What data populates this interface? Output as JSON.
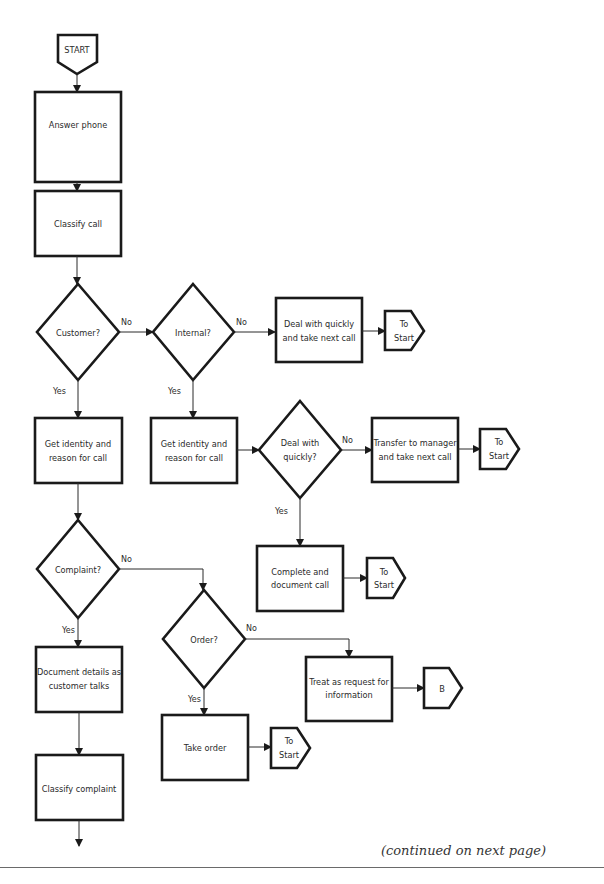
{
  "flowchart": {
    "start": {
      "label": "START"
    },
    "nodes": {
      "answer_phone": {
        "label": "Answer phone"
      },
      "classify_call": {
        "label": "Classify call"
      },
      "customer_q": {
        "label": "Customer?"
      },
      "internal_q": {
        "label": "Internal?"
      },
      "deal_quick_take_next": {
        "line1": "Deal with quickly",
        "line2": "and take next call"
      },
      "get_identity_left": {
        "line1": "Get identity and",
        "line2": "reason for call"
      },
      "get_identity_mid": {
        "line1": "Get identity and",
        "line2": "reason for call"
      },
      "deal_quickly_q": {
        "line1": "Deal with",
        "line2": "quickly?"
      },
      "transfer_manager": {
        "line1": "Transfer to manager",
        "line2": "and take next call"
      },
      "complete_document": {
        "line1": "Complete and",
        "line2": "document call"
      },
      "complaint_q": {
        "label": "Complaint?"
      },
      "order_q": {
        "label": "Order?"
      },
      "treat_request": {
        "line1": "Treat as request for",
        "line2": "information"
      },
      "document_details": {
        "line1": "Document details as",
        "line2": "customer talks"
      },
      "take_order": {
        "label": "Take order"
      },
      "classify_complaint": {
        "label": "Classify complaint"
      }
    },
    "connectors": {
      "to_start_1": {
        "line1": "To",
        "line2": "Start"
      },
      "to_start_2": {
        "line1": "To",
        "line2": "Start"
      },
      "to_start_3": {
        "line1": "To",
        "line2": "Start"
      },
      "to_start_4": {
        "line1": "To",
        "line2": "Start"
      },
      "b": {
        "label": "B"
      }
    },
    "edge_labels": {
      "yes": "Yes",
      "no": "No"
    }
  },
  "footer": {
    "continued": "(continued on next page)"
  }
}
